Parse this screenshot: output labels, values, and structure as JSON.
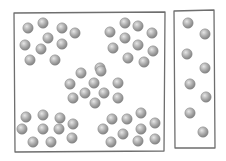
{
  "colors": {
    "background": "#ffffff",
    "frame_stroke": "#6e6e6e",
    "ball_light": "#e6e6e6",
    "ball_mid": "#a9a9a9",
    "ball_dark": "#7c7c7c",
    "ball_stroke": "#8a8a8a"
  },
  "ball_radius": 5.2,
  "containers": [
    {
      "name": "large-container",
      "frame": {
        "x1": 14,
        "y1": 13,
        "x2": 165,
        "y2": 12,
        "x3": 164,
        "y3": 151,
        "x4": 15,
        "y4": 152
      },
      "clusters": [
        {
          "name": "cluster-top-left",
          "balls": [
            [
              28,
              28
            ],
            [
              43,
              23
            ],
            [
              62,
              28
            ],
            [
              75,
              33
            ],
            [
              48,
              38
            ],
            [
              25,
              45
            ],
            [
              41,
              49
            ],
            [
              62,
              44
            ],
            [
              30,
              60
            ],
            [
              55,
              60
            ]
          ]
        },
        {
          "name": "cluster-top-right",
          "balls": [
            [
              110,
              32
            ],
            [
              125,
              23
            ],
            [
              138,
              26
            ],
            [
              152,
              33
            ],
            [
              125,
              38
            ],
            [
              113,
              48
            ],
            [
              138,
              45
            ],
            [
              153,
              51
            ],
            [
              128,
              58
            ],
            [
              144,
              62
            ]
          ]
        },
        {
          "name": "cluster-middle",
          "balls": [
            [
              100,
              68
            ],
            [
              81,
              73
            ],
            [
              101,
              71
            ],
            [
              70,
              84
            ],
            [
              94,
              83
            ],
            [
              118,
              83
            ],
            [
              85,
              93
            ],
            [
              104,
              93
            ],
            [
              73,
              98
            ],
            [
              118,
              98
            ],
            [
              95,
              103
            ]
          ]
        },
        {
          "name": "cluster-bottom-left",
          "balls": [
            [
              26,
              117
            ],
            [
              43,
              115
            ],
            [
              60,
              118
            ],
            [
              73,
              124
            ],
            [
              22,
              129
            ],
            [
              43,
              129
            ],
            [
              59,
              129
            ],
            [
              33,
              142
            ],
            [
              51,
              142
            ],
            [
              72,
              138
            ]
          ]
        },
        {
          "name": "cluster-bottom-right",
          "balls": [
            [
              112,
              119
            ],
            [
              127,
              119
            ],
            [
              141,
              113
            ],
            [
              155,
              123
            ],
            [
              103,
              129
            ],
            [
              123,
              134
            ],
            [
              141,
              129
            ],
            [
              111,
              142
            ],
            [
              138,
              141
            ],
            [
              155,
              139
            ]
          ]
        }
      ]
    },
    {
      "name": "small-container",
      "frame": {
        "x1": 174,
        "y1": 11,
        "x2": 214,
        "y2": 10,
        "x3": 215,
        "y3": 148,
        "x4": 175,
        "y4": 148
      },
      "clusters": [
        {
          "name": "column-balls",
          "balls": [
            [
              188,
              23
            ],
            [
              205,
              34
            ],
            [
              187,
              54
            ],
            [
              205,
              68
            ],
            [
              190,
              84
            ],
            [
              206,
              97
            ],
            [
              190,
              113
            ],
            [
              203,
              132
            ]
          ]
        }
      ]
    }
  ]
}
